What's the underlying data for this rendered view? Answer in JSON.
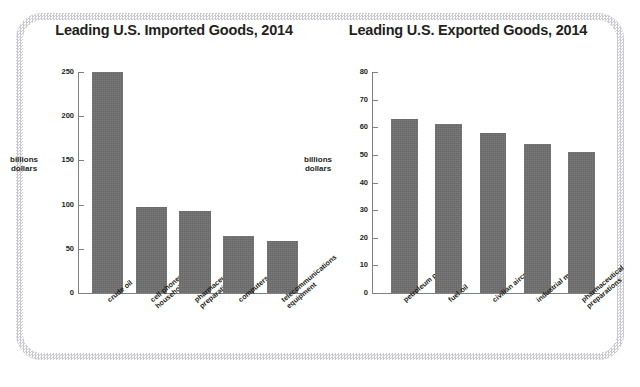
{
  "figure": {
    "background_color": "#ffffff",
    "frame_color": "#d8d8dc",
    "bar_color": "#6e6e6e",
    "axis_color": "#808080",
    "text_color": "#231f20"
  },
  "chart_data": [
    {
      "id": "imports",
      "type": "bar",
      "title": "Leading U.S. Imported Goods, 2014",
      "xlabel": "",
      "ylabel": "billions dollars",
      "ylabel_lines": [
        "billions",
        "dollars"
      ],
      "categories": [
        "crude oil",
        "cell phones and other household goods",
        "pharmaceutical preparations",
        "computers",
        "telecommunications equipment"
      ],
      "category_lines": [
        [
          "crude oil"
        ],
        [
          "cell phones and other",
          "household goods"
        ],
        [
          "pharmaceutical",
          "preparations"
        ],
        [
          "computers"
        ],
        [
          "telecommunications",
          "equipment"
        ]
      ],
      "values": [
        250,
        97,
        93,
        64,
        59
      ],
      "ylim": [
        0,
        250
      ],
      "yticks": [
        0,
        50,
        100,
        150,
        200,
        250
      ],
      "grid": false,
      "legend": "none"
    },
    {
      "id": "exports",
      "type": "bar",
      "title": "Leading U.S. Exported Goods, 2014",
      "xlabel": "",
      "ylabel": "billions dollars",
      "ylabel_lines": [
        "billions",
        "dollars"
      ],
      "categories": [
        "petroleum products",
        "fuel oil",
        "civilian aircraft",
        "industrial machines",
        "pharmaceutical preparations"
      ],
      "category_lines": [
        [
          "petroleum products"
        ],
        [
          "fuel oil"
        ],
        [
          "civilian aircraft"
        ],
        [
          "industrial machines"
        ],
        [
          "pharmaceutical",
          "preparations"
        ]
      ],
      "values": [
        63,
        61,
        58,
        54,
        51
      ],
      "ylim": [
        0,
        80
      ],
      "yticks": [
        0,
        10,
        20,
        30,
        40,
        50,
        60,
        70,
        80
      ],
      "grid": false,
      "legend": "none"
    }
  ]
}
